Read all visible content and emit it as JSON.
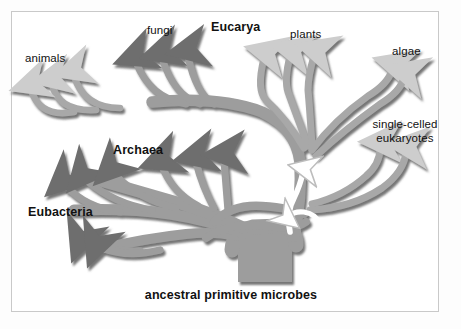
{
  "figure": {
    "caption": "ancestral primitive microbes",
    "background_color": "#ffffff",
    "frame_color": "#c9c9c9"
  },
  "labels": {
    "animals": "animals",
    "fungi": "fungi",
    "eucarya": "Eucarya",
    "plants": "plants",
    "algae": "algae",
    "single_celled_eukaryotes": "single-celled\neukaryotes",
    "single_celled_eukaryotes_line1": "single-celled",
    "single_celled_eukaryotes_line2": "eukaryotes",
    "archaea": "Archaea",
    "eubacteria": "Eubacteria",
    "ancestral": "ancestral primitive microbes"
  },
  "domains": [
    {
      "name": "Eucarya",
      "emphasis": "bold",
      "groups": [
        "animals",
        "fungi",
        "plants",
        "algae",
        "single-celled eukaryotes"
      ]
    },
    {
      "name": "Archaea",
      "emphasis": "bold",
      "groups": []
    },
    {
      "name": "Eubacteria",
      "emphasis": "bold",
      "groups": []
    }
  ],
  "colors": {
    "branch_fill": "#9d9d9d",
    "branch_fill_light": "#aaaaaa",
    "branch_shadow": "#6f6f6f",
    "arrow_dark": "#6f6f6f",
    "arrow_light": "#c8c8c8",
    "endosymbiosis_arrow": "#ffffff",
    "text": "#111111"
  },
  "annotations": {
    "endosymbiosis_arrow_count": 2,
    "endosymbiosis_note": "white curved arrows indicating endosymbiotic events from prokaryotes into the eukaryotic lineage"
  }
}
